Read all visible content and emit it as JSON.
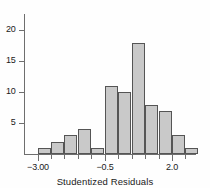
{
  "chart_data": {
    "type": "bar",
    "title": "",
    "xlabel": "Studentized Residuals",
    "ylabel": "",
    "bin_edges": [
      -3.0,
      -2.5,
      -2.0,
      -1.5,
      -1.0,
      -0.5,
      0.0,
      0.5,
      1.0,
      1.5,
      2.0,
      2.5
    ],
    "categories": [
      "-3.0 to -2.5",
      "-2.5 to -2.0",
      "-2.0 to -1.5",
      "-1.5 to -1.0",
      "-1.0 to -0.5",
      "-0.5 to 0.0",
      "0.0 to 0.5",
      "0.5 to 1.0",
      "1.0 to 1.5",
      "1.5 to 2.0",
      "2.0 to 2.5",
      "2.5 to 3.0"
    ],
    "values": [
      1,
      2,
      3,
      4,
      1,
      11,
      10,
      18,
      8,
      7,
      3,
      1
    ],
    "xlim": [
      -3.25,
      2.85
    ],
    "ylim": [
      0,
      23
    ],
    "xticks": [
      -3.0,
      -0.5,
      2.0
    ],
    "xtick_labels": [
      "−3.00",
      "−0.5",
      "2.0"
    ],
    "yticks": [
      5,
      10,
      15,
      20
    ],
    "ytick_labels": [
      "5",
      "10",
      "15",
      "20"
    ],
    "grid": false,
    "legend": false,
    "bar_fill": "#c9c9c9",
    "bar_edge": "#555555",
    "axis_color": "#6e6e6e"
  }
}
